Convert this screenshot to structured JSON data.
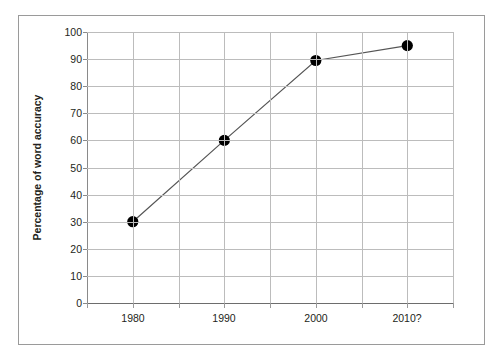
{
  "figure": {
    "border_color": "#9a9a9a",
    "background": "#ffffff"
  },
  "chart_data": {
    "type": "line",
    "title": "",
    "subtitle": "",
    "xlabel": "",
    "ylabel": "Percentage of word accuracy",
    "categories": [
      "1980",
      "1990",
      "2000",
      "2010?"
    ],
    "values": [
      30,
      60,
      89.5,
      95
    ],
    "series": [
      {
        "name": "Percentage of word accuracy",
        "values": [
          30,
          60,
          89.5,
          95
        ],
        "line_color": "#555555",
        "marker_color": "#000000",
        "marker": "circle"
      }
    ],
    "ylim": [
      0,
      100
    ],
    "ytick_labels": [
      "0",
      "10",
      "20",
      "30",
      "40",
      "50",
      "60",
      "70",
      "80",
      "90",
      "100"
    ],
    "ytick_values": [
      0,
      10,
      20,
      30,
      40,
      50,
      60,
      70,
      80,
      90,
      100
    ],
    "xtick_labels": [
      "1980",
      "1990",
      "2000",
      "2010?"
    ],
    "grid": "both",
    "grid_color": "#bcbcbc",
    "legend": "none",
    "legend_position": "none",
    "annotations": []
  }
}
